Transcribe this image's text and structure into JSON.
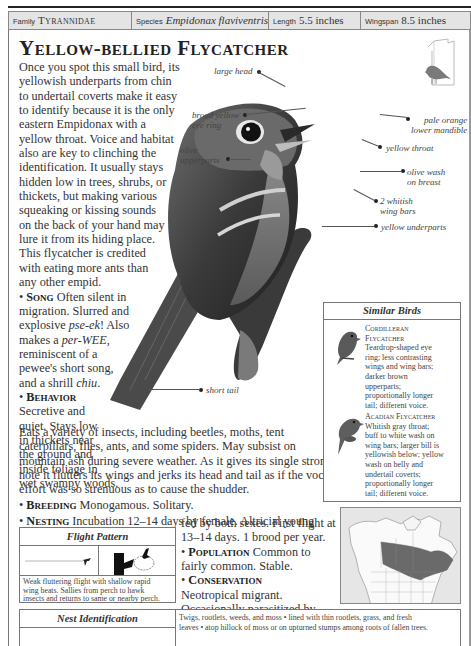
{
  "header": {
    "family_label": "Family",
    "family_value": "Tyrannidae",
    "species_label": "Species",
    "species_value": "Empidonax flaviventris",
    "length_label": "Length",
    "length_value": "5.5 inches",
    "wingspan_label": "Wingspan",
    "wingspan_value": "8.5 inches"
  },
  "title": "Yellow-bellied Flycatcher",
  "intro_lines": [
    "Once you spot this small bird, its",
    "yellowish underparts from chin",
    "to undertail coverts make it easy",
    "to identify because it is the only",
    "eastern Empidonax with a",
    "yellow throat. Voice and habitat",
    "also are key to clinching the",
    "identification. It usually stays",
    "hidden low in trees, shrubs, or",
    "thickets, but making various",
    "squeaking or kissing sounds",
    "on the back of your hand may",
    "lure it from its hiding place.",
    "This flycatcher is credited",
    "with eating more ants than",
    "any other empid."
  ],
  "song": {
    "heading": "Song",
    "lines_pre": "Often silent in",
    "l2": "migration. Slurred and",
    "l3a": "explosive ",
    "l3i": "pse-ek",
    "l3b": "! Also",
    "l4a": "makes a ",
    "l4i": "per-WEE",
    "l4b": ",",
    "l5": "reminiscent of a",
    "l6": "pewee's short song,",
    "l7a": "and a shrill ",
    "l7i": "chiu",
    "l7b": "."
  },
  "behavior": {
    "heading": "Behavior",
    "narrow_lines": [
      "Secretive and",
      "quiet. Stays low",
      "in thickets near",
      "the ground and",
      "inside foliage in",
      "wet swampy woods."
    ],
    "wide_lines": [
      "Eats a variety of insects, including beetles, moths, tent",
      "caterpillars, flies, ants, and some spiders. May subsist on",
      "mountain ash during severe weather. As it gives its single strong",
      "note it flutters its wings and jerks its head and tail as if the vocal",
      "effort was so strenuous as to cause the shudder."
    ]
  },
  "breeding": {
    "heading": "Breeding",
    "text": "Monogamous. Solitary."
  },
  "nesting": {
    "heading": "Nesting",
    "line1": "Incubation 12–14 days by female. Altricial young",
    "line2": "fed by both sexes. First flight at",
    "line3": "13–14 days. 1 brood per year."
  },
  "population": {
    "heading": "Population",
    "line1": "Common to",
    "line2": "fairly common. Stable."
  },
  "conservation": {
    "heading": "Conservation",
    "lines": [
      "Neotropical migrant.",
      "Occasionally parasitized by",
      "Brown-headed Cowbird."
    ]
  },
  "labels": {
    "large_head": "large head",
    "eye_ring_1": "broad yellow",
    "eye_ring_2": "eye ring",
    "upperparts_1": "olive",
    "upperparts_2": "upperparts",
    "mandible_1": "pale orange",
    "mandible_2": "lower mandible",
    "throat": "yellow throat",
    "breast_1": "olive wash",
    "breast_2": "on breast",
    "wingbars_1": "2 whitish",
    "wingbars_2": "wing bars",
    "underparts": "yellow underparts",
    "tail": "short tail"
  },
  "similar_birds": {
    "title": "Similar Birds",
    "birds": [
      {
        "name_1": "Cordilleran",
        "name_2": "Flycatcher",
        "desc": [
          "Teardrop-shaped eye",
          "ring; less contrasting",
          "wings and wing bars;",
          "darker brown",
          "upperparts;",
          "proportionally longer",
          "tail; different voice."
        ]
      },
      {
        "name_1": "Acadian Flycatcher",
        "desc": [
          "Whitish gray throat;",
          "buff to white wash on",
          "wing bars; larger bill is",
          "yellowish below; yellow",
          "wash on belly and",
          "undertail coverts;",
          "proportionally longer",
          "tail; different voice."
        ]
      }
    ]
  },
  "flight_pattern": {
    "title": "Flight Pattern",
    "desc": [
      "Weak fluttering flight with shallow rapid",
      "wing beats. Sallies from perch to hawk",
      "insects and returns to same or nearby perch."
    ]
  },
  "nest_identification": {
    "title": "Nest Identification",
    "desc": [
      "Twigs, rootlets, weeds, and moss • lined with thin rootlets, grass, and fresh",
      "leaves • atop hillock of moss or on upturned stumps among roots of fallen trees."
    ]
  },
  "colors": {
    "header_bg": "#e4e4e4",
    "border": "#777777",
    "range_fill": "#6a6a6a",
    "map_bg": "#e6e6e6"
  }
}
